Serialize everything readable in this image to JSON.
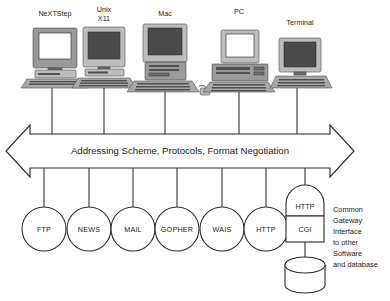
{
  "diagram": {
    "machines": [
      {
        "id": "nextstep",
        "label": "NeXTStep",
        "icon": "desktop-computer-icon"
      },
      {
        "id": "unix-x11",
        "label": "Unix\nX11",
        "label_line1": "Unix",
        "label_line2": "X11",
        "icon": "desktop-computer-icon"
      },
      {
        "id": "mac",
        "label": "Mac",
        "icon": "macintosh-computer-icon"
      },
      {
        "id": "pc",
        "label": "PC",
        "icon": "pc-computer-icon"
      },
      {
        "id": "terminal",
        "label": "Terminal",
        "icon": "terminal-icon"
      }
    ],
    "banner": {
      "label": "Addressing Scheme, Protocols, Format Negotiation",
      "shape": "double-headed-arrow"
    },
    "services": [
      {
        "id": "ftp",
        "label": "FTP"
      },
      {
        "id": "news",
        "label": "NEWS"
      },
      {
        "id": "mail",
        "label": "MAIL"
      },
      {
        "id": "gopher",
        "label": "GOPHER"
      },
      {
        "id": "wais",
        "label": "WAIS"
      },
      {
        "id": "http",
        "label": "HTTP"
      }
    ],
    "gateway": {
      "top_label": "HTTP",
      "bottom_label": "CGI",
      "database_icon": "database-cylinder-icon"
    },
    "note": {
      "lines": [
        "Common",
        "Gateway",
        "Interface",
        "to other",
        "Software",
        "and database"
      ]
    },
    "colors": {
      "stroke": "#2b2b2b",
      "text": "#1a1a1a",
      "background": "#ffffff",
      "case_gray": "#9a9a9a",
      "screen_dark": "#4a4a4a"
    }
  }
}
